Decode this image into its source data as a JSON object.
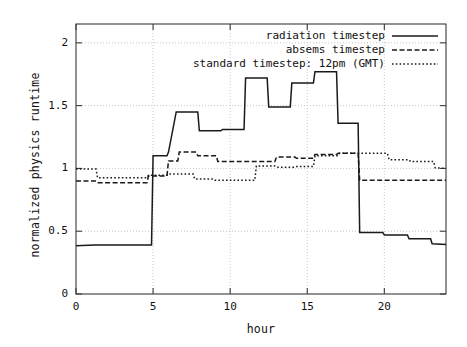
{
  "chart_data": {
    "type": "line",
    "title": "",
    "xlabel": "hour",
    "ylabel": "normalized physics runtime",
    "xlim": [
      0,
      24
    ],
    "ylim": [
      0,
      2.15
    ],
    "xticks": [
      0,
      5,
      10,
      15,
      20
    ],
    "yticks": [
      0,
      0.5,
      1,
      1.5,
      2
    ],
    "grid": true,
    "legend_position": "top-right-inside",
    "interpolation": "step",
    "series": [
      {
        "name": "radiation timestep",
        "style": "solid",
        "color": "#1a1a1a",
        "x": [
          0,
          1.2,
          4.9,
          5.0,
          5.9,
          6.0,
          6.5,
          7.9,
          8.0,
          9.4,
          9.5,
          10.9,
          11.0,
          12.4,
          12.5,
          13.9,
          14.0,
          15.4,
          15.5,
          16.9,
          17.0,
          18.3,
          18.4,
          19.9,
          20.0,
          21.5,
          21.6,
          23.0,
          23.1,
          24
        ],
        "y": [
          0.385,
          0.39,
          0.39,
          1.1,
          1.1,
          1.13,
          1.45,
          1.45,
          1.3,
          1.3,
          1.31,
          1.31,
          1.72,
          1.72,
          1.49,
          1.49,
          1.68,
          1.68,
          1.77,
          1.77,
          1.36,
          1.36,
          0.49,
          0.49,
          0.47,
          0.47,
          0.44,
          0.44,
          0.4,
          0.395
        ]
      },
      {
        "name": "absems timestep",
        "style": "dashed",
        "color": "#1a1a1a",
        "x": [
          0,
          1.3,
          1.4,
          4.6,
          4.7,
          5.9,
          6.0,
          6.6,
          6.7,
          7.8,
          7.9,
          9.1,
          9.2,
          12.9,
          13.0,
          14.2,
          14.3,
          15.4,
          15.5,
          16.9,
          17.0,
          18.3,
          18.4,
          24
        ],
        "y": [
          0.9,
          0.9,
          0.885,
          0.885,
          0.94,
          0.94,
          1.06,
          1.06,
          1.13,
          1.13,
          1.1,
          1.1,
          1.055,
          1.055,
          1.09,
          1.09,
          1.08,
          1.08,
          1.11,
          1.11,
          1.12,
          1.12,
          0.905,
          0.905
        ]
      },
      {
        "name": "standard timestep: 12pm (GMT)",
        "style": "dotted",
        "color": "#1a1a1a",
        "x": [
          0,
          1.3,
          1.4,
          4.6,
          4.7,
          5.9,
          6.0,
          7.6,
          7.7,
          8.9,
          9.0,
          11.6,
          11.7,
          12.9,
          13.0,
          14.2,
          14.3,
          15.4,
          15.5,
          17.0,
          17.1,
          18.3,
          18.4,
          20.2,
          20.3,
          21.6,
          21.7,
          23.2,
          23.3,
          24
        ],
        "y": [
          0.995,
          0.995,
          0.925,
          0.925,
          0.945,
          0.945,
          0.955,
          0.955,
          0.915,
          0.915,
          0.905,
          0.905,
          1.02,
          1.02,
          1.01,
          1.01,
          1.015,
          1.015,
          1.1,
          1.1,
          1.12,
          1.12,
          1.12,
          1.12,
          1.07,
          1.07,
          1.055,
          1.055,
          1.005,
          1.0
        ]
      }
    ]
  },
  "axes": {
    "ylabel": "normalized physics runtime",
    "xlabel": "hour",
    "ytick_labels": [
      "0",
      "0.5",
      "1",
      "1.5",
      "2"
    ],
    "xtick_labels": [
      "0",
      "5",
      "10",
      "15",
      "20"
    ]
  },
  "legend": {
    "entries": [
      {
        "label": "radiation timestep",
        "style": "solid"
      },
      {
        "label": "absems timestep",
        "style": "dashed"
      },
      {
        "label": "standard timestep: 12pm (GMT)",
        "style": "dotted"
      }
    ]
  }
}
